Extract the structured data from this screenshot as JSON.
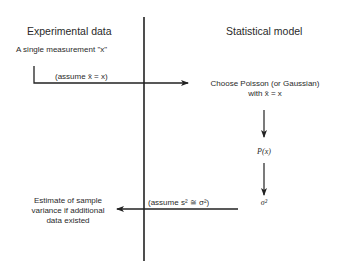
{
  "left_panel": {
    "title": "Experimental data",
    "measurement_label": "A single measurement \"x\"",
    "assumption_top": "(assume x̄ = x)",
    "result_lines": [
      "Estimate of sample",
      "variance if additional",
      "data existed"
    ]
  },
  "right_panel": {
    "title": "Statistical model",
    "step1_line1": "Choose Poisson (or Gaussian)",
    "step1_line2": "with x̄ = x",
    "step2": "P(x)",
    "step3": "σ²",
    "assumption_bottom": "(assume s² ≅ σ²)"
  },
  "colors": {
    "line": "#222222",
    "text": "#2a2a2a",
    "background": "#ffffff"
  }
}
